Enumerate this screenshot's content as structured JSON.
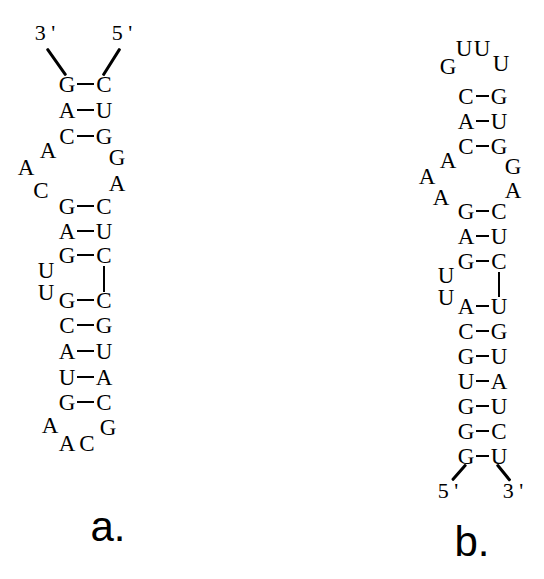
{
  "figure": {
    "background_color": "#ffffff",
    "ink_color": "#000000"
  },
  "panels": [
    {
      "id": "a",
      "label": "a.",
      "label_x": 108,
      "label_y": 527,
      "five_prime": {
        "text": "5 '",
        "x": 122,
        "y": 33
      },
      "three_prime": {
        "text": "3 '",
        "x": 45,
        "y": 33
      },
      "tails": [
        {
          "name": "three-prime-tail",
          "x1": 47,
          "y1": 47,
          "x2": 66,
          "y2": 74
        },
        {
          "name": "five-prime-tail",
          "x1": 120,
          "y1": 47,
          "x2": 103,
          "y2": 74
        }
      ],
      "pairs": [
        {
          "left": "G",
          "right": "C",
          "lx": 67,
          "rx": 104,
          "y": 84,
          "bond": true
        },
        {
          "left": "A",
          "right": "U",
          "lx": 67,
          "rx": 104,
          "y": 110,
          "bond": true
        },
        {
          "left": "C",
          "right": "G",
          "lx": 67,
          "rx": 104,
          "y": 136,
          "bond": true
        },
        {
          "left": "G",
          "right": "C",
          "lx": 67,
          "rx": 104,
          "y": 206,
          "bond": true
        },
        {
          "left": "A",
          "right": "U",
          "lx": 67,
          "rx": 104,
          "y": 231,
          "bond": true
        },
        {
          "left": "G",
          "right": "C",
          "lx": 67,
          "rx": 104,
          "y": 255,
          "bond": true
        },
        {
          "left": "G",
          "right": "C",
          "lx": 67,
          "rx": 104,
          "y": 300,
          "bond": true
        },
        {
          "left": "C",
          "right": "G",
          "lx": 67,
          "rx": 104,
          "y": 325,
          "bond": true
        },
        {
          "left": "A",
          "right": "U",
          "lx": 67,
          "rx": 104,
          "y": 351,
          "bond": true
        },
        {
          "left": "U",
          "right": "A",
          "lx": 67,
          "rx": 104,
          "y": 377,
          "bond": true
        },
        {
          "left": "G",
          "right": "C",
          "lx": 67,
          "rx": 104,
          "y": 402,
          "bond": true
        }
      ],
      "vbonds": [
        {
          "name": "backbone-connector-right",
          "x": 104,
          "y1": 266,
          "y2": 292
        }
      ],
      "loose": [
        {
          "base": "A",
          "x": 48,
          "y": 150,
          "name": "internal-loop-base"
        },
        {
          "base": "A",
          "x": 26,
          "y": 167,
          "name": "internal-loop-base"
        },
        {
          "base": "C",
          "x": 41,
          "y": 190,
          "name": "internal-loop-base"
        },
        {
          "base": "G",
          "x": 117,
          "y": 157,
          "name": "internal-loop-base"
        },
        {
          "base": "A",
          "x": 117,
          "y": 183,
          "name": "internal-loop-base"
        },
        {
          "base": "U",
          "x": 46,
          "y": 270,
          "name": "bulge-base"
        },
        {
          "base": "U",
          "x": 46,
          "y": 292,
          "name": "bulge-base"
        },
        {
          "base": "A",
          "x": 50,
          "y": 425,
          "name": "hairpin-loop-base"
        },
        {
          "base": "A",
          "x": 67,
          "y": 443,
          "name": "hairpin-loop-base"
        },
        {
          "base": "C",
          "x": 87,
          "y": 443,
          "name": "hairpin-loop-base"
        },
        {
          "base": "G",
          "x": 108,
          "y": 427,
          "name": "hairpin-loop-base"
        }
      ]
    },
    {
      "id": "b",
      "label": "b.",
      "label_x": 472,
      "label_y": 542,
      "five_prime": {
        "text": "5 '",
        "x": 448,
        "y": 491
      },
      "three_prime": {
        "text": "3 '",
        "x": 513,
        "y": 491
      },
      "tails": [
        {
          "name": "five-prime-tail",
          "x1": 466,
          "y1": 463,
          "x2": 452,
          "y2": 479
        },
        {
          "name": "three-prime-tail",
          "x1": 497,
          "y1": 463,
          "x2": 510,
          "y2": 479
        }
      ],
      "pairs": [
        {
          "left": "C",
          "right": "G",
          "lx": 466,
          "rx": 499,
          "y": 96,
          "bond": true
        },
        {
          "left": "A",
          "right": "U",
          "lx": 466,
          "rx": 499,
          "y": 121,
          "bond": true
        },
        {
          "left": "C",
          "right": "G",
          "lx": 466,
          "rx": 499,
          "y": 146,
          "bond": true
        },
        {
          "left": "G",
          "right": "C",
          "lx": 466,
          "rx": 499,
          "y": 211,
          "bond": true
        },
        {
          "left": "A",
          "right": "U",
          "lx": 466,
          "rx": 499,
          "y": 236,
          "bond": true
        },
        {
          "left": "G",
          "right": "C",
          "lx": 466,
          "rx": 499,
          "y": 261,
          "bond": true
        },
        {
          "left": "A",
          "right": "U",
          "lx": 466,
          "rx": 499,
          "y": 306,
          "bond": true
        },
        {
          "left": "C",
          "right": "G",
          "lx": 466,
          "rx": 499,
          "y": 331,
          "bond": true
        },
        {
          "left": "G",
          "right": "U",
          "lx": 466,
          "rx": 499,
          "y": 356,
          "bond": true
        },
        {
          "left": "U",
          "right": "A",
          "lx": 466,
          "rx": 499,
          "y": 381,
          "bond": true
        },
        {
          "left": "G",
          "right": "U",
          "lx": 466,
          "rx": 499,
          "y": 406,
          "bond": true
        },
        {
          "left": "G",
          "right": "C",
          "lx": 466,
          "rx": 499,
          "y": 431,
          "bond": true
        },
        {
          "left": "G",
          "right": "U",
          "lx": 466,
          "rx": 499,
          "y": 456,
          "bond": true
        }
      ],
      "vbonds": [
        {
          "name": "backbone-connector-right",
          "x": 499,
          "y1": 272,
          "y2": 297
        }
      ],
      "loose": [
        {
          "base": "G",
          "x": 448,
          "y": 66,
          "name": "hairpin-loop-base"
        },
        {
          "base": "U",
          "x": 464,
          "y": 48,
          "name": "hairpin-loop-base"
        },
        {
          "base": "U",
          "x": 482,
          "y": 48,
          "name": "hairpin-loop-base"
        },
        {
          "base": "U",
          "x": 501,
          "y": 63,
          "name": "hairpin-loop-base"
        },
        {
          "base": "A",
          "x": 448,
          "y": 160,
          "name": "internal-loop-base"
        },
        {
          "base": "A",
          "x": 427,
          "y": 176,
          "name": "internal-loop-base"
        },
        {
          "base": "A",
          "x": 441,
          "y": 197,
          "name": "internal-loop-base"
        },
        {
          "base": "G",
          "x": 513,
          "y": 166,
          "name": "internal-loop-base"
        },
        {
          "base": "A",
          "x": 513,
          "y": 190,
          "name": "internal-loop-base"
        },
        {
          "base": "U",
          "x": 446,
          "y": 275,
          "name": "bulge-base"
        },
        {
          "base": "U",
          "x": 446,
          "y": 297,
          "name": "bulge-base"
        }
      ]
    }
  ]
}
